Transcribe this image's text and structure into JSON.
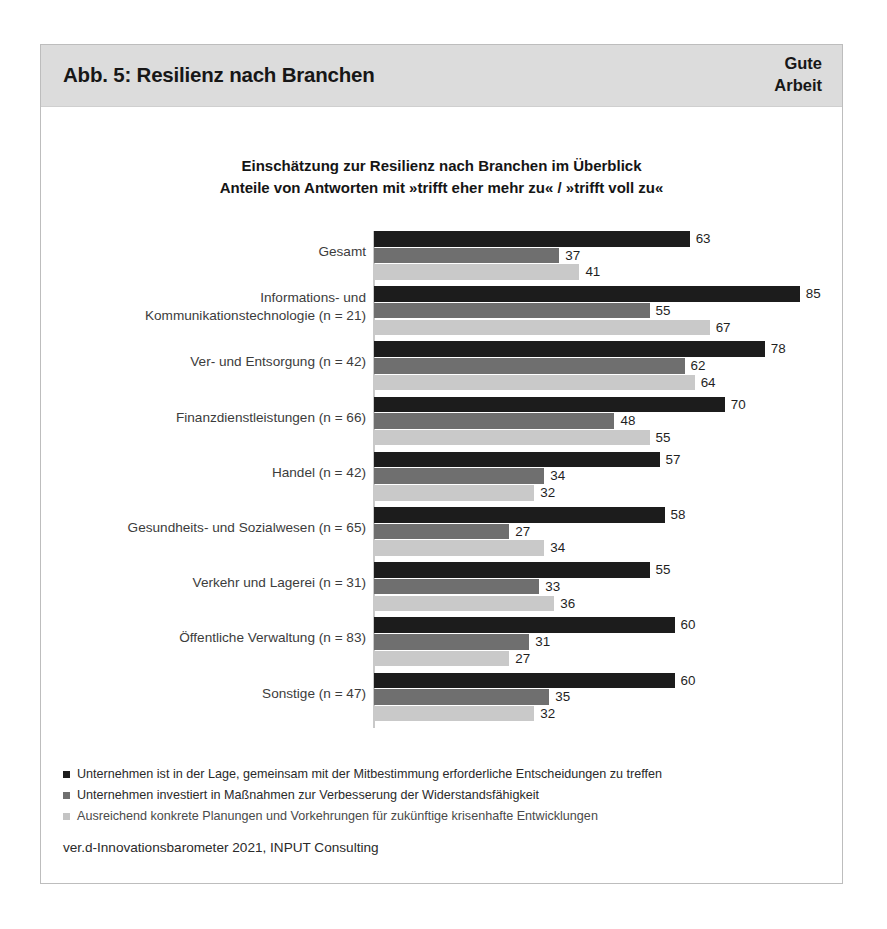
{
  "figure": {
    "header_title": "Abb. 5: Resilienz nach Branchen",
    "brand_line1": "Gute",
    "brand_line2": "Arbeit",
    "chart_title_line1": "Einschätzung zur Resilienz nach Branchen im Überblick",
    "chart_title_line2": "Anteile von Antworten mit »trifft eher mehr zu« / »trifft voll zu«",
    "source": "ver.d-Innovationsbarometer 2021, INPUT Consulting"
  },
  "colors": {
    "series_0": "#1c1c1c",
    "series_1": "#6f6f6f",
    "series_2": "#c9c9c9",
    "header_band": "#dcdcdc",
    "frame_border": "#bdbdbd",
    "axis_line": "#c9c9c9"
  },
  "chart_data": {
    "type": "bar",
    "orientation": "horizontal",
    "title": "Einschätzung zur Resilienz nach Branchen im Überblick",
    "subtitle": "Anteile von Antworten mit »trifft eher mehr zu« / »trifft voll zu«",
    "xlabel": "",
    "ylabel": "",
    "xlim": [
      0,
      100
    ],
    "grid": false,
    "legend_position": "bottom-left",
    "value_unit": "percent",
    "categories": [
      "Gesamt",
      "Informations- und Kommunikationstechnologie (n = 21)",
      "Ver- und Entsorgung (n = 42)",
      "Finanzdienstleistungen (n = 66)",
      "Handel (n = 42)",
      "Gesundheits- und Sozialwesen (n = 65)",
      "Verkehr und Lagerei (n = 31)",
      "Öffentliche Verwaltung (n = 83)",
      "Sonstige (n = 47)"
    ],
    "category_lines": [
      [
        "Gesamt"
      ],
      [
        "Informations- und",
        "Kommunikationstechnologie (n = 21)"
      ],
      [
        "Ver- und Entsorgung (n = 42)"
      ],
      [
        "Finanzdienstleistungen (n = 66)"
      ],
      [
        "Handel (n = 42)"
      ],
      [
        "Gesundheits- und Sozialwesen (n = 65)"
      ],
      [
        "Verkehr und Lagerei (n = 31)"
      ],
      [
        "Öffentliche Verwaltung (n = 83)"
      ],
      [
        "Sonstige (n = 47)"
      ]
    ],
    "series": [
      {
        "name": "Unternehmen ist in der Lage, gemeinsam mit der Mitbestimmung erforderliche Entscheidungen zu treffen",
        "color": "#1c1c1c",
        "values": [
          63,
          85,
          78,
          70,
          57,
          58,
          55,
          60,
          60
        ]
      },
      {
        "name": "Unternehmen investiert in Maßnahmen zur Verbesserung der Widerstandsfähigkeit",
        "color": "#6f6f6f",
        "values": [
          37,
          55,
          62,
          48,
          34,
          27,
          33,
          31,
          35
        ]
      },
      {
        "name": "Ausreichend konkrete Planungen und Vorkehrungen für zukünftige krisenhafte Entwicklungen",
        "color": "#c9c9c9",
        "values": [
          41,
          67,
          64,
          55,
          32,
          34,
          36,
          27,
          32
        ]
      }
    ]
  }
}
